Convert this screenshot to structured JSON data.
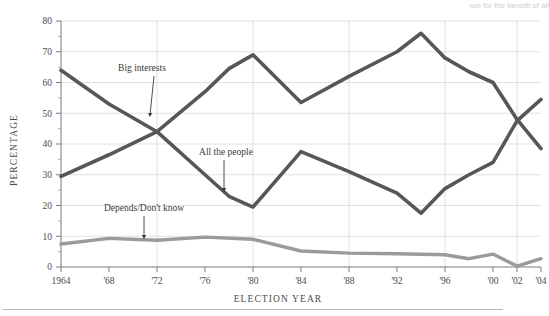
{
  "figure": {
    "top_caption_fragment": "run for the benefit of all",
    "bottom_rule": "horizontal-rule"
  },
  "chart_data": {
    "type": "line",
    "title": "",
    "xlabel": "ELECTION YEAR",
    "ylabel": "PERCENTAGE",
    "xlim": [
      1964,
      2004
    ],
    "ylim": [
      0,
      80
    ],
    "grid": true,
    "grid_axis": "both",
    "legend_position": "inline-annotations",
    "y_ticks": [
      0,
      10,
      20,
      30,
      40,
      50,
      60,
      70,
      80
    ],
    "y_tick_labels": [
      "0",
      "10",
      "20",
      "30",
      "40",
      "50",
      "60",
      "70",
      "80"
    ],
    "y_minor_ticks": [
      5,
      15,
      25,
      35,
      45,
      55,
      65,
      75
    ],
    "x_ticks": [
      1964,
      1968,
      1972,
      1976,
      1980,
      1984,
      1988,
      1992,
      1996,
      2000,
      2002,
      2004
    ],
    "x_tick_labels": [
      "1964",
      "'68",
      "'72",
      "'76",
      "'80",
      "'84",
      "'88",
      "'92",
      "'96",
      "'00",
      "'02",
      "'04"
    ],
    "x_gridlines": [
      1972,
      1980,
      1988,
      1996,
      2002
    ],
    "series": [
      {
        "name": "Big interests",
        "color": "#575757",
        "width": 3.6,
        "x": [
          1964,
          1968,
          1972,
          1976,
          1978,
          1980,
          1984,
          1988,
          1992,
          1994,
          1996,
          1998,
          2000,
          2002,
          2004
        ],
        "values": [
          29.5,
          36.5,
          44.0,
          57.0,
          64.5,
          69.0,
          53.5,
          62.0,
          70.0,
          76.0,
          68.0,
          63.5,
          60.0,
          48.0,
          38.5
        ]
      },
      {
        "name": "All the people",
        "color": "#575757",
        "width": 3.6,
        "x": [
          1964,
          1968,
          1972,
          1976,
          1978,
          1980,
          1984,
          1988,
          1992,
          1994,
          1996,
          1998,
          2000,
          2002,
          2004
        ],
        "values": [
          64.0,
          53.0,
          44.0,
          30.0,
          23.0,
          19.5,
          37.5,
          31.0,
          24.0,
          17.5,
          25.5,
          30.0,
          34.0,
          47.5,
          54.5
        ]
      },
      {
        "name": "Depends/Don't know",
        "color": "#9a9a9a",
        "width": 3.4,
        "x": [
          1964,
          1968,
          1972,
          1976,
          1980,
          1984,
          1988,
          1992,
          1996,
          1998,
          2000,
          2002,
          2004
        ],
        "values": [
          7.5,
          9.3,
          8.7,
          9.7,
          9.0,
          5.2,
          4.5,
          4.3,
          4.0,
          2.7,
          4.2,
          0.3,
          2.7
        ]
      }
    ],
    "annotations": [
      {
        "text": "Big interests",
        "label_x": 142,
        "label_y": 71,
        "arrow_from_x": 154,
        "arrow_from_y": 76,
        "arrow_to_x": 150,
        "arrow_to_y": 115,
        "target_series": "Big interests"
      },
      {
        "text": "All the people",
        "label_x": 226,
        "label_y": 155,
        "arrow_from_x": 224,
        "arrow_from_y": 160,
        "arrow_to_x": 224,
        "arrow_to_y": 190,
        "target_series": "All the people"
      },
      {
        "text": "Depends/Don't know",
        "label_x": 144,
        "label_y": 211,
        "arrow_from_x": 144,
        "arrow_from_y": 216,
        "arrow_to_x": 144,
        "arrow_to_y": 237,
        "target_series": "Depends/Don't know"
      }
    ]
  }
}
